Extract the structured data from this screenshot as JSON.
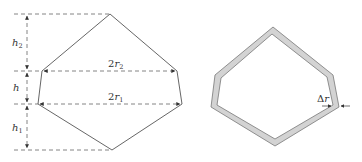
{
  "left_figure": {
    "labels": {
      "h2": {
        "main": "h",
        "sub": "2"
      },
      "h": {
        "main": "h",
        "sub": ""
      },
      "h1": {
        "main": "h",
        "sub": "1"
      },
      "r2": {
        "prefix": "2",
        "main": "r",
        "sub": "2"
      },
      "r1": {
        "prefix": "2",
        "main": "r",
        "sub": "1"
      }
    },
    "vertices": {
      "top": [
        110,
        14
      ],
      "upper_left": [
        42,
        71
      ],
      "upper_right": [
        177,
        71
      ],
      "lower_left": [
        38,
        104
      ],
      "lower_right": [
        182,
        104
      ],
      "bottom": [
        112,
        150
      ]
    },
    "dim_lines_y": [
      14,
      71,
      104,
      150
    ],
    "dim_line_x": 27
  },
  "right_figure": {
    "label": {
      "prefix": "Δ",
      "main": "r"
    },
    "fill_color": "#d3d3d3",
    "stroke_color": "#777777"
  },
  "colors": {
    "line": "#555555",
    "dash": "#666666"
  }
}
